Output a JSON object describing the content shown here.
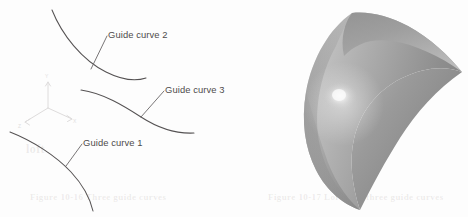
{
  "figure": {
    "width": 468,
    "height": 217,
    "background_color": "#fdfdfd",
    "curve_stroke_color": "#555253",
    "label_text_color": "#4e4b4c",
    "triad_color": "#dedcdc",
    "surface_light_color": "#f2f2f2",
    "surface_mid_color": "#b9b9b9",
    "surface_dark_color": "#7c7c7c",
    "surface_highlight_color": "#fbfbfb"
  },
  "left_panel": {
    "labels": [
      {
        "id": "guide-curve-2",
        "text": "Guide curve 2",
        "x": 108,
        "y": 30
      },
      {
        "id": "guide-curve-3",
        "text": "Guide curve 3",
        "x": 165,
        "y": 85
      },
      {
        "id": "guide-curve-1",
        "text": "Guide curve 1",
        "x": 83,
        "y": 138
      }
    ],
    "curves": [
      {
        "id": "guide-curve-2",
        "name": "Guide curve 2",
        "path": "M 52 10 C 62 35, 82 60, 106 72 C 124 81, 137 81, 146 78"
      },
      {
        "id": "guide-curve-3",
        "name": "Guide curve 3",
        "path": "M 81 90 C 103 93, 124 106, 141 117 C 158 128, 175 134, 194 133"
      },
      {
        "id": "guide-curve-1",
        "name": "Guide curve 1",
        "path": "M 10 132 C 33 141, 56 156, 71 172 C 84 186, 90 198, 93 211"
      }
    ],
    "leaders": [
      {
        "id": "leader-curve-2",
        "path": "M 91 69 L 107 36"
      },
      {
        "id": "leader-curve-3",
        "path": "M 141 117 L 164 92"
      },
      {
        "id": "leader-curve-1",
        "path": "M 66 166 L 82 144"
      }
    ],
    "triad": {
      "origin_x": 48,
      "origin_y": 108,
      "axes": [
        {
          "id": "y-axis",
          "label": "Y",
          "path": "M 48 108 L 48 82",
          "label_x": 46,
          "label_y": 79
        },
        {
          "id": "x-axis",
          "label": "X",
          "path": "M 48 108 L 72 119",
          "label_x": 73,
          "label_y": 122
        },
        {
          "id": "z-axis",
          "label": "Z",
          "path": "M 48 108 L 25 122",
          "label_x": 20,
          "label_y": 127
        }
      ]
    }
  },
  "right_panel": {
    "surface": {
      "id": "lofted-surface",
      "name": "lofted-surface",
      "description": "shaded 3D lofted surface",
      "apex_x": 352,
      "apex_y": 12,
      "tip_x": 360,
      "tip_y": 210
    }
  },
  "artifacts": {
    "bleed_lines": [
      {
        "id": "bleed-bottom-left",
        "text": "Figure 10-16  Three guide curves",
        "x": 30,
        "y": 197,
        "size": 9
      },
      {
        "id": "bleed-bottom-right",
        "text": "Figure 10-17  Loft with three guide curves",
        "x": 268,
        "y": 197,
        "size": 9
      },
      {
        "id": "bleed-mid-left",
        "text": "loft",
        "x": 26,
        "y": 148,
        "size": 12
      },
      {
        "id": "bleed-mid-right",
        "text": "surface",
        "x": 388,
        "y": 42,
        "size": 10
      }
    ]
  }
}
